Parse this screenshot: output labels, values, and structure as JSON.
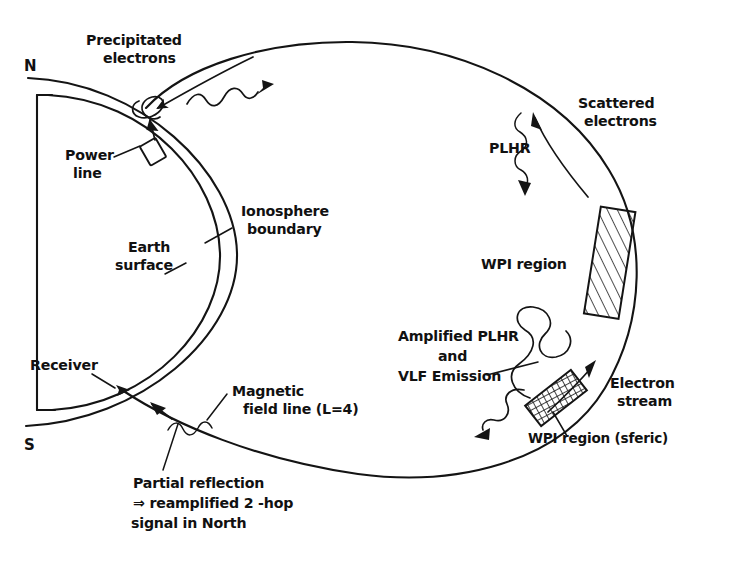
{
  "figure": {
    "type": "schematic-diagram"
  },
  "poles": {
    "north": "N",
    "south": "S"
  },
  "labels": {
    "precipitated_electrons_line1": "Precipitated",
    "precipitated_electrons_line2": "electrons",
    "power_line_line1": "Power",
    "power_line_line2": "line",
    "ionosphere_line1": "Ionosphere",
    "ionosphere_line2": "boundary",
    "earth_line1": "Earth",
    "earth_line2": "surface",
    "receiver": "Receiver",
    "magnetic_line1": "Magnetic",
    "magnetic_line2": "field line (L=4)",
    "partial_line1": "Partial reflection",
    "partial_line2": "⇒ reamplified 2 -hop",
    "partial_line3": "signal in North",
    "scattered_line1": "Scattered",
    "scattered_line2": "electrons",
    "plhr": "PLHR",
    "wpi_region": "WPI region",
    "amplified_line1": "Amplified PLHR",
    "amplified_line2": "and",
    "amplified_line3": "VLF Emission",
    "electron_stream_line1": "Electron",
    "electron_stream_line2": "stream",
    "wpi_region_sferic": "WPI region (sferic)"
  },
  "colors": {
    "ink": "#141414",
    "background": "#ffffff"
  },
  "elements": {
    "rotation_axis": "vertical-axis",
    "earth_surface_arc": "earth-surface-arc",
    "ionosphere_arc": "ionosphere-boundary-arc",
    "field_line_loop": "magnetic-field-line-loop",
    "wpi_box_hatched": "wpi-region-box",
    "wpi_box_sferic": "wpi-region-sferic-box",
    "power_line_marker": "power-line-marker",
    "loss_cone_marker": "loss-cone-marker",
    "receiver_marker": "receiver-marker"
  }
}
